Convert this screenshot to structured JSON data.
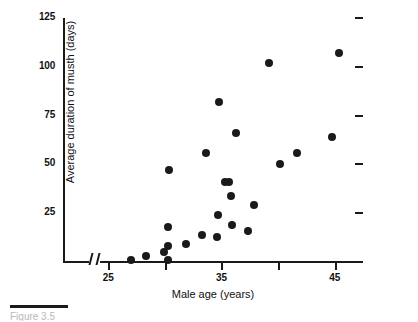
{
  "chart_data": {
    "type": "scatter",
    "title": "",
    "xlabel": "Male age (years)",
    "ylabel": "Average duration of musth (days)",
    "xlim": [
      21,
      47.5
    ],
    "ylim": [
      0,
      125
    ],
    "xticks": [
      25,
      30,
      35,
      40,
      45
    ],
    "xtick_labels": [
      "25",
      "",
      "35",
      "",
      "45"
    ],
    "yticks": [
      25,
      50,
      75,
      100,
      125
    ],
    "ytick_labels": [
      "25",
      "50",
      "75",
      "100",
      "125"
    ],
    "grid": false,
    "legend": null,
    "axis_break_x": true,
    "marker": "filled-circle",
    "marker_color": "#1a1a1a",
    "points": [
      {
        "x": 27.0,
        "y": 1
      },
      {
        "x": 28.3,
        "y": 3
      },
      {
        "x": 29.9,
        "y": 5
      },
      {
        "x": 30.3,
        "y": 1
      },
      {
        "x": 30.3,
        "y": 8
      },
      {
        "x": 30.3,
        "y": 18
      },
      {
        "x": 30.4,
        "y": 47
      },
      {
        "x": 31.9,
        "y": 9
      },
      {
        "x": 33.3,
        "y": 14
      },
      {
        "x": 33.6,
        "y": 56
      },
      {
        "x": 34.6,
        "y": 13
      },
      {
        "x": 34.7,
        "y": 24
      },
      {
        "x": 34.8,
        "y": 82
      },
      {
        "x": 35.3,
        "y": 41
      },
      {
        "x": 35.7,
        "y": 41
      },
      {
        "x": 35.8,
        "y": 34
      },
      {
        "x": 35.9,
        "y": 19
      },
      {
        "x": 36.3,
        "y": 66
      },
      {
        "x": 37.3,
        "y": 16
      },
      {
        "x": 37.9,
        "y": 29
      },
      {
        "x": 39.2,
        "y": 102
      },
      {
        "x": 40.2,
        "y": 50
      },
      {
        "x": 41.7,
        "y": 56
      },
      {
        "x": 44.8,
        "y": 64
      },
      {
        "x": 45.4,
        "y": 107
      }
    ]
  },
  "caption": {
    "text": "Figure 3.5"
  }
}
